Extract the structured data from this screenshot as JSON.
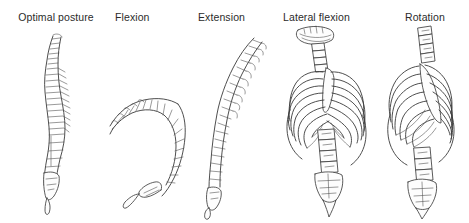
{
  "figure": {
    "background_color": "#ffffff",
    "ink_color": "#3a3a3a",
    "label_color": "#2b2b2b",
    "panels": [
      {
        "id": "optimal-posture",
        "label": "Optimal posture",
        "view": "lateral view of vertebral column in neutral alignment",
        "subject": "vertebral-column",
        "regions": [
          "cervical",
          "thoracic",
          "lumbar",
          "sacrum",
          "coccyx"
        ]
      },
      {
        "id": "flexion",
        "label": "Flexion",
        "view": "lateral view of vertebral column bent forward into a C-curve",
        "subject": "vertebral-column",
        "regions": [
          "cervical",
          "thoracic",
          "lumbar",
          "sacrum",
          "coccyx"
        ]
      },
      {
        "id": "extension",
        "label": "Extension",
        "view": "lateral view of vertebral column arched backward",
        "subject": "vertebral-column",
        "regions": [
          "cervical",
          "thoracic",
          "lumbar",
          "sacrum",
          "coccyx"
        ]
      },
      {
        "id": "lateral-flexion",
        "label": "Lateral flexion",
        "view": "anterior view of thorax and spine side-bent to one side",
        "subject": "thorax-and-vertebral-column",
        "regions": [
          "mandible",
          "cervical",
          "ribcage",
          "sternum",
          "lumbar",
          "sacrum"
        ]
      },
      {
        "id": "rotation",
        "label": "Rotation",
        "view": "anterior oblique view of thorax twisted about the vertical axis",
        "subject": "thorax-and-vertebral-column",
        "regions": [
          "cervical",
          "ribcage",
          "sternum",
          "lumbar",
          "sacrum"
        ]
      }
    ]
  }
}
